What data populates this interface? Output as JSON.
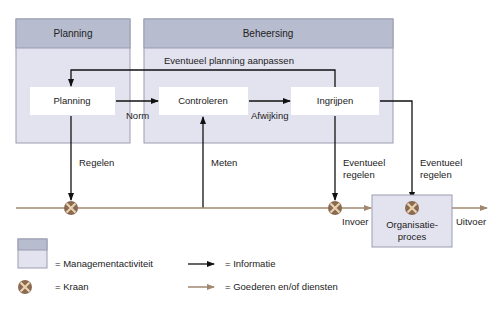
{
  "colors": {
    "panel_header": "#b8bccf",
    "panel_body": "#e3e3f0",
    "panel_border": "#9a9cb0",
    "inner_box": "#ffffff",
    "info_line": "#111111",
    "goods_line": "#a08870",
    "valve": "#8a6a50",
    "valve_x": "#e8d2b0"
  },
  "panels": {
    "planning": {
      "title": "Planning"
    },
    "beheersing": {
      "title": "Beheersing",
      "feedback_label": "Eventueel planning aanpassen"
    }
  },
  "nodes": {
    "planning": "Planning",
    "controleren": "Controleren",
    "ingrijpen": "Ingrijpen",
    "organisatieproces_line1": "Organisatie-",
    "organisatieproces_line2": "proces"
  },
  "edges": {
    "norm": "Norm",
    "afwijking": "Afwijking",
    "regelen": "Regelen",
    "meten": "Meten",
    "eventueel_regelen_1_line1": "Eventueel",
    "eventueel_regelen_1_line2": "regelen",
    "eventueel_regelen_2_line1": "Eventueel",
    "eventueel_regelen_2_line2": "regelen",
    "invoer": "Invoer",
    "uitvoer": "Uitvoer"
  },
  "legend": {
    "management": "= Managementactiviteit",
    "kraan": "= Kraan",
    "informatie": "= Informatie",
    "goederen": "= Goederen en/of diensten"
  }
}
